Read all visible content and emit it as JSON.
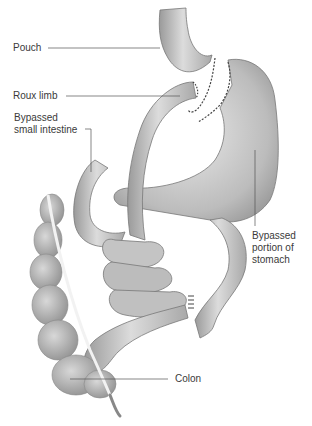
{
  "diagram": {
    "type": "anatomical-illustration",
    "labels": [
      {
        "id": "pouch",
        "text": "Pouch"
      },
      {
        "id": "roux_limb",
        "text": "Roux limb"
      },
      {
        "id": "bypassed_small_intestine",
        "text": "Bypassed\nsmall intestine"
      },
      {
        "id": "bypassed_stomach",
        "text": "Bypassed\nportion of\nstomach"
      },
      {
        "id": "colon",
        "text": "Colon"
      }
    ],
    "colors": {
      "organ_fill": "#bdbdbd",
      "organ_light": "#e6e6e6",
      "organ_dark": "#8a8a8a",
      "outline": "#777777",
      "leader_line": "#555555",
      "staple": "#444444"
    }
  }
}
